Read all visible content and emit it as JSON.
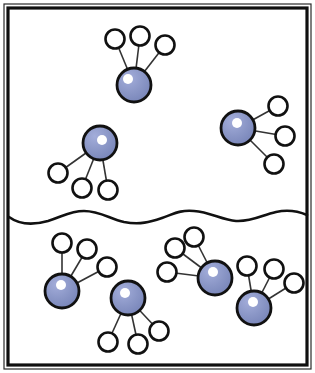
{
  "figure": {
    "width": 315,
    "height": 373,
    "background_color": "#ffffff"
  },
  "frame": {
    "name": "enclosing-box",
    "outer_line_color": "#2b2b2b",
    "inner_line_color": "#0f0f0f",
    "outer_stroke_width": 1.2,
    "inner_stroke_width": 3.2,
    "outer": {
      "x": 4,
      "y": 4,
      "width": 307,
      "height": 365
    },
    "inner": {
      "x": 8,
      "y": 8,
      "width": 299,
      "height": 357
    }
  },
  "interface": {
    "name": "wavy-interface-line",
    "stroke_color": "#111111",
    "stroke_width": 2.6,
    "path": "M 9 217 C 20 225, 34 225, 48 221 C 64 216, 70 211, 84 211 C 100 211, 110 219, 124 222 C 140 225, 150 222, 162 218 C 176 213, 180 210, 194 211 C 210 212, 222 220, 236 221 C 252 222, 262 215, 276 212 C 290 209, 300 212, 307 215"
  },
  "style": {
    "center_fill": "#8490c2",
    "center_fill_light": "#9aa5d0",
    "center_stroke": "#111111",
    "center_stroke_width": 2.8,
    "center_radius": 17,
    "highlight_fill": "#ffffff",
    "highlight_radius": 5,
    "satellite_fill": "#ffffff",
    "satellite_stroke": "#111111",
    "satellite_stroke_width": 2.6,
    "satellite_radius": 9.5,
    "bond_stroke": "#333333",
    "bond_stroke_width": 1.6
  },
  "regions": [
    {
      "name": "upper-phase",
      "label": "above interface"
    },
    {
      "name": "lower-phase",
      "label": "below interface"
    }
  ],
  "molecules": [
    {
      "id": "molecule-top-center",
      "region": "upper-phase",
      "center": {
        "x": 134,
        "y": 85
      },
      "highlight": {
        "x": 128,
        "y": 79
      },
      "satellites": [
        {
          "x": 115,
          "y": 39
        },
        {
          "x": 140,
          "y": 36
        },
        {
          "x": 165,
          "y": 45
        }
      ]
    },
    {
      "id": "molecule-upper-left",
      "region": "upper-phase",
      "center": {
        "x": 100,
        "y": 143
      },
      "highlight": {
        "x": 102,
        "y": 140
      },
      "satellites": [
        {
          "x": 58,
          "y": 173
        },
        {
          "x": 82,
          "y": 188
        },
        {
          "x": 108,
          "y": 190
        }
      ]
    },
    {
      "id": "molecule-upper-right",
      "region": "upper-phase",
      "center": {
        "x": 238,
        "y": 128
      },
      "highlight": {
        "x": 237,
        "y": 123
      },
      "satellites": [
        {
          "x": 278,
          "y": 106
        },
        {
          "x": 285,
          "y": 136
        },
        {
          "x": 274,
          "y": 164
        }
      ]
    },
    {
      "id": "molecule-lower-left",
      "region": "lower-phase",
      "center": {
        "x": 62,
        "y": 291
      },
      "highlight": {
        "x": 61,
        "y": 285
      },
      "satellites": [
        {
          "x": 62,
          "y": 243
        },
        {
          "x": 87,
          "y": 249
        },
        {
          "x": 107,
          "y": 267
        }
      ]
    },
    {
      "id": "molecule-lower-left-inner",
      "region": "lower-phase",
      "center": {
        "x": 128,
        "y": 298
      },
      "highlight": {
        "x": 125,
        "y": 293
      },
      "satellites": [
        {
          "x": 108,
          "y": 342
        },
        {
          "x": 138,
          "y": 344
        },
        {
          "x": 159,
          "y": 331
        }
      ]
    },
    {
      "id": "molecule-lower-middle",
      "region": "lower-phase",
      "center": {
        "x": 215,
        "y": 278
      },
      "highlight": {
        "x": 213,
        "y": 272
      },
      "satellites": [
        {
          "x": 194,
          "y": 237
        },
        {
          "x": 175,
          "y": 248
        },
        {
          "x": 167,
          "y": 272
        }
      ]
    },
    {
      "id": "molecule-lower-right",
      "region": "lower-phase",
      "center": {
        "x": 254,
        "y": 308
      },
      "highlight": {
        "x": 253,
        "y": 302
      },
      "satellites": [
        {
          "x": 247,
          "y": 266
        },
        {
          "x": 274,
          "y": 269
        },
        {
          "x": 294,
          "y": 283
        }
      ]
    }
  ]
}
